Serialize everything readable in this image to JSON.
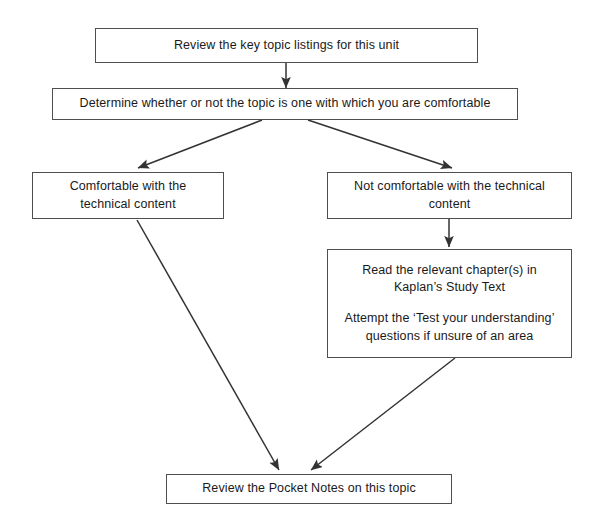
{
  "diagram": {
    "stroke_color": "#4f4f4f",
    "arrow_color": "#333333",
    "background": "#ffffff",
    "nodes": {
      "review_listings": {
        "id": "review-key-topic-listings",
        "lines": [
          "Review the key topic listings for this unit"
        ]
      },
      "determine_comfort": {
        "id": "determine-comfort",
        "lines": [
          "Determine whether or not the topic is one with which you are comfortable"
        ]
      },
      "comfortable": {
        "id": "comfortable-with-content",
        "lines": [
          "Comfortable with the",
          "technical content"
        ]
      },
      "not_comfortable": {
        "id": "not-comfortable-with-content",
        "lines": [
          "Not comfortable with the technical",
          "content"
        ]
      },
      "read_chapters": {
        "id": "read-relevant-chapters",
        "lines": [
          "Read the relevant chapter(s) in",
          "Kaplan’s Study Text",
          "",
          "Attempt the ‘Test your understanding’",
          "questions if unsure of an area"
        ]
      },
      "review_pocket_notes": {
        "id": "review-pocket-notes",
        "lines": [
          "Review the Pocket Notes on this topic"
        ]
      }
    },
    "edges": [
      {
        "from": "review_listings",
        "to": "determine_comfort",
        "kind": "vertical-arrow"
      },
      {
        "from": "determine_comfort",
        "to": "comfortable",
        "kind": "diagonal-arrow-left"
      },
      {
        "from": "determine_comfort",
        "to": "not_comfortable",
        "kind": "diagonal-arrow-right"
      },
      {
        "from": "not_comfortable",
        "to": "read_chapters",
        "kind": "vertical-arrow"
      },
      {
        "from": "comfortable",
        "to": "review_pocket_notes",
        "kind": "diagonal-arrow-down-right"
      },
      {
        "from": "read_chapters",
        "to": "review_pocket_notes",
        "kind": "diagonal-arrow-down-left"
      }
    ]
  }
}
